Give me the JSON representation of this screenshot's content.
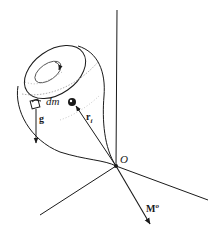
{
  "diagram": {
    "labels": {
      "mass_element": "dm",
      "gravity": "g",
      "position_vector": "r",
      "position_vector_subscript": "i",
      "origin": "O",
      "moment": "M",
      "moment_superscript": "o"
    },
    "colors": {
      "ink": "#1a1a1a",
      "shading": "#9a9a9a",
      "background": "#ffffff"
    }
  }
}
